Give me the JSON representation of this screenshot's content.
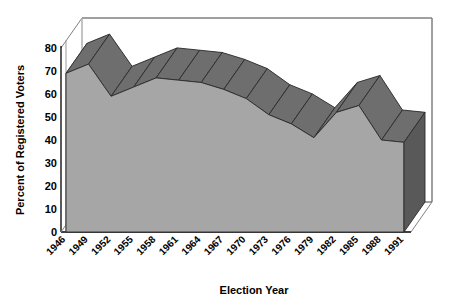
{
  "chart_data": {
    "type": "area",
    "title": "",
    "subtitle": "",
    "xlabel": "Election  Year",
    "ylabel": "Percent of Registered Voters",
    "categories": [
      "1946",
      "1949",
      "1952",
      "1955",
      "1958",
      "1961",
      "1964",
      "1967",
      "1970",
      "1973",
      "1976",
      "1979",
      "1982",
      "1985",
      "1988",
      "1991"
    ],
    "values": [
      69,
      73,
      59,
      63,
      67,
      66,
      65,
      62,
      58,
      51,
      47,
      41,
      52,
      55,
      40,
      39
    ],
    "ylim": [
      0,
      80
    ],
    "yticks": [
      "0",
      "10",
      "20",
      "30",
      "40",
      "50",
      "60",
      "70",
      "80"
    ],
    "grid": false,
    "legend": "none",
    "style": "3d-area",
    "colors": {
      "area_fill": "#a6a6a6",
      "area_top": "#6e6e6e",
      "area_side": "#595959",
      "axis": "#000000",
      "background": "#ffffff",
      "wall": "#ffffff"
    }
  },
  "axis": {
    "y_title": "Percent of Registered Voters",
    "x_title": "Election  Year"
  }
}
